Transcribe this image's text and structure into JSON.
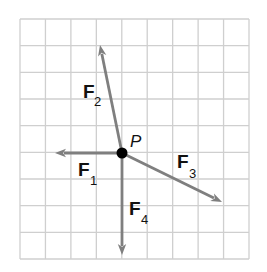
{
  "diagram": {
    "grid": {
      "x0": 20,
      "y0": 19,
      "x1": 249,
      "y1": 259,
      "cols": 9,
      "rows": 9,
      "line_color": "#cfcfcf"
    },
    "arrow_color": "#7f7f7f",
    "point": {
      "label": "P",
      "x": 122,
      "y": 153,
      "color": "#000000"
    },
    "vectors": [
      {
        "name": "F",
        "subscript": "1",
        "tip_x": 55,
        "tip_y": 153,
        "label_x": 78,
        "label_y": 176,
        "sub_x": 90,
        "sub_y": 185
      },
      {
        "name": "F",
        "subscript": "2",
        "tip_x": 100,
        "tip_y": 45,
        "label_x": 83,
        "label_y": 98,
        "sub_x": 94,
        "sub_y": 106
      },
      {
        "name": "F",
        "subscript": "3",
        "tip_x": 222,
        "tip_y": 202,
        "label_x": 177,
        "label_y": 168,
        "sub_x": 189,
        "sub_y": 178
      },
      {
        "name": "F",
        "subscript": "4",
        "tip_x": 122,
        "tip_y": 255,
        "label_x": 129,
        "label_y": 215,
        "sub_x": 141,
        "sub_y": 224
      }
    ]
  }
}
